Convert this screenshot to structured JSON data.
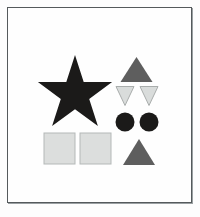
{
  "figure": {
    "canvas": {
      "width": 200,
      "height": 217
    },
    "background_color": "#fdfdfd",
    "frame": {
      "name": "outer-frame",
      "x": 7,
      "y": 7,
      "width": 185,
      "height": 196,
      "border_color": "#555a5c",
      "fill_color": "#fefefe",
      "shadow_color": "#9aa0a2",
      "border_width": 1
    },
    "palette": {
      "dark": "#1b1a19",
      "medium_gray": "#5e5e5e",
      "light_gray": "#d9dcdb",
      "light_gray_outline": "#a9adac",
      "square_fill": "#dcdedd",
      "square_outline": "#b4b8b7"
    },
    "shape_count": 9,
    "shapes": [
      {
        "id": "star-large",
        "name": "star",
        "label": "Large five-pointed star",
        "type": "star",
        "points": 5,
        "fill": "#1b1a19",
        "stroke": "none",
        "center_x": 75,
        "center_y": 94,
        "outer_radius": 39,
        "inner_radius": 15.5,
        "rotation_deg": -90,
        "polygon": "75,55 83.7,82.1 112.1,82.1 89.2,98.9 97.9,126 75,109.2 52.1,126 60.8,98.9 37.9,82.1 66.3,82.1"
      },
      {
        "id": "triangle-up-top",
        "name": "triangle-up",
        "label": "Upward triangle, top right",
        "type": "triangle",
        "direction": "up",
        "fill": "#5e5e5e",
        "stroke": "none",
        "polygon": "136.5,57 152.5,82 120.5,82"
      },
      {
        "id": "triangle-down-left",
        "name": "triangle-down",
        "label": "Downward triangle, left of pair",
        "type": "triangle",
        "direction": "down",
        "fill": "#d9dcdb",
        "stroke": "#a9adac",
        "stroke_width": 1,
        "polygon": "116,86.5 134,86.5 125,105.5"
      },
      {
        "id": "triangle-down-right",
        "name": "triangle-down",
        "label": "Downward triangle, right of pair",
        "type": "triangle",
        "direction": "down",
        "fill": "#d9dcdb",
        "stroke": "#a9adac",
        "stroke_width": 1,
        "polygon": "140,86.5 158,86.5 149,105.5"
      },
      {
        "id": "circle-left",
        "name": "circle",
        "label": "Dark circle, left",
        "type": "circle",
        "fill": "#1b1a19",
        "stroke": "none",
        "cx": 125,
        "cy": 122,
        "r": 9.5
      },
      {
        "id": "circle-right",
        "name": "circle",
        "label": "Dark circle, right",
        "type": "circle",
        "fill": "#1b1a19",
        "stroke": "none",
        "cx": 149,
        "cy": 122,
        "r": 9.5
      },
      {
        "id": "square-left",
        "name": "square",
        "label": "Light square, left",
        "type": "square",
        "fill": "#dcdedd",
        "stroke": "#b4b8b7",
        "stroke_width": 1,
        "x": 44,
        "y": 133,
        "width": 31,
        "height": 31
      },
      {
        "id": "square-right",
        "name": "square",
        "label": "Light square, right",
        "type": "square",
        "fill": "#dcdedd",
        "stroke": "#b4b8b7",
        "stroke_width": 1,
        "x": 80,
        "y": 133,
        "width": 31,
        "height": 31
      },
      {
        "id": "triangle-up-bottom",
        "name": "triangle-up",
        "label": "Upward triangle, bottom right",
        "type": "triangle",
        "direction": "up",
        "fill": "#5e5e5e",
        "stroke": "none",
        "polygon": "139,139 155,165 123,165"
      }
    ]
  }
}
